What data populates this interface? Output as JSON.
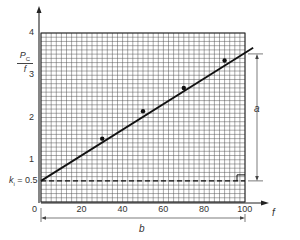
{
  "chart_data": {
    "type": "line",
    "title": "",
    "xlabel": "f",
    "ylabel": "P_C / f",
    "ylabel_parts": {
      "numerator": "P",
      "sub": "C",
      "denominator": "f"
    },
    "xlim": [
      0,
      100
    ],
    "ylim": [
      0,
      4
    ],
    "x_ticks": [
      "0",
      "20",
      "40",
      "60",
      "80",
      "100"
    ],
    "y_ticks": [
      "1",
      "2",
      "3",
      "4"
    ],
    "grid": true,
    "grid_minor_step": {
      "x": 2.5,
      "y": 0.1
    },
    "points": [
      {
        "x": 30,
        "y": 1.5
      },
      {
        "x": 50,
        "y": 2.15
      },
      {
        "x": 70,
        "y": 2.7
      },
      {
        "x": 90,
        "y": 3.35
      }
    ],
    "fit_line": {
      "x": [
        0,
        104
      ],
      "y": [
        0.5,
        3.65
      ]
    },
    "intercept": {
      "label_k": "k",
      "label_sub": "i",
      "label_rest": " = 0.5",
      "value": 0.5
    },
    "annotations": {
      "a": "a",
      "b": "b",
      "a_description": "vertical rise of fitted line from 0.5 at f = 0 to value at f = 100",
      "b_description": "horizontal span from f = 0 to f = 100"
    }
  }
}
